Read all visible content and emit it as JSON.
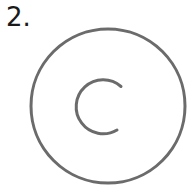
{
  "figure": {
    "number_label": "2.",
    "outer_circle": {
      "cx": 108,
      "cy": 106,
      "r": 77,
      "stroke": "#6b6b6b",
      "stroke_width": 3
    },
    "inner_arc": {
      "cx": 101,
      "cy": 106,
      "r": 27,
      "stroke": "#6b6b6b",
      "stroke_width": 3,
      "shape": "C (open to the right)"
    }
  }
}
